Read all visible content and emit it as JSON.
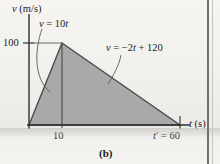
{
  "figure": {
    "caption": "(b)",
    "colors": {
      "fill": "#a9a9a9",
      "stroke": "#3c3c3c",
      "text": "#1b1b1b",
      "background": "#f3f1ee"
    }
  },
  "axes": {
    "y_axis_label": "v (m/s)",
    "x_axis_label": "t (s)",
    "y_ticks": [
      "100"
    ],
    "x_ticks": [
      "10",
      "t' = 60"
    ]
  },
  "annotations": {
    "rising_equation": "v = 10t",
    "falling_equation": "v = −2t + 120"
  },
  "chart_data": {
    "type": "line",
    "title": "",
    "xlabel": "t (s)",
    "ylabel": "v (m/s)",
    "xlim": [
      0,
      66
    ],
    "ylim": [
      0,
      118
    ],
    "grid": false,
    "legend": "none",
    "x": [
      0,
      10,
      60
    ],
    "values": [
      0,
      100,
      0
    ],
    "series": [
      {
        "name": "v = 10t",
        "x": [
          0,
          10
        ],
        "values": [
          0,
          100
        ],
        "equation": "v = 10t",
        "slope": 10,
        "intercept": 0
      },
      {
        "name": "v = −2t + 120",
        "x": [
          10,
          60
        ],
        "values": [
          100,
          0
        ],
        "equation": "v = −2t + 120",
        "slope": -2,
        "intercept": 120
      }
    ],
    "shaded_region": {
      "label": "area under v-t curve",
      "vertices": [
        [
          0,
          0
        ],
        [
          10,
          100
        ],
        [
          60,
          0
        ]
      ]
    },
    "annotations": [
      {
        "text": "v = 10t",
        "x": 5,
        "y": 112
      },
      {
        "text": "v = −2t + 120",
        "x": 30,
        "y": 90
      },
      {
        "text": "100",
        "x": -3,
        "y": 100
      },
      {
        "text": "10",
        "x": 10,
        "y": -10
      },
      {
        "text": "t' = 60",
        "x": 60,
        "y": -10
      }
    ]
  }
}
